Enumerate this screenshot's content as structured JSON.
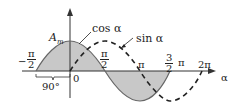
{
  "diagram": {
    "title": "",
    "axis": {
      "x_label": "α",
      "origin_label": "0"
    },
    "amplitude_label": "A",
    "amplitude_subscript": "m",
    "curves": [
      {
        "name": "cos α",
        "style": "solid",
        "fill": "shaded"
      },
      {
        "name": "sin α",
        "style": "dashed"
      }
    ],
    "ticks": [
      {
        "label": "−π/2",
        "num": "π",
        "den": "2",
        "neg": "−"
      },
      {
        "label": "π/2",
        "num": "π",
        "den": "2"
      },
      {
        "label": "π"
      },
      {
        "label": "3/2 π",
        "num": "3",
        "den": "2",
        "suffix": "π"
      },
      {
        "label": "2π"
      }
    ],
    "phase_shift_label": "90°",
    "colors": {
      "fill": "#c8c8c8",
      "stroke": "#333333",
      "text": "#222222"
    }
  }
}
